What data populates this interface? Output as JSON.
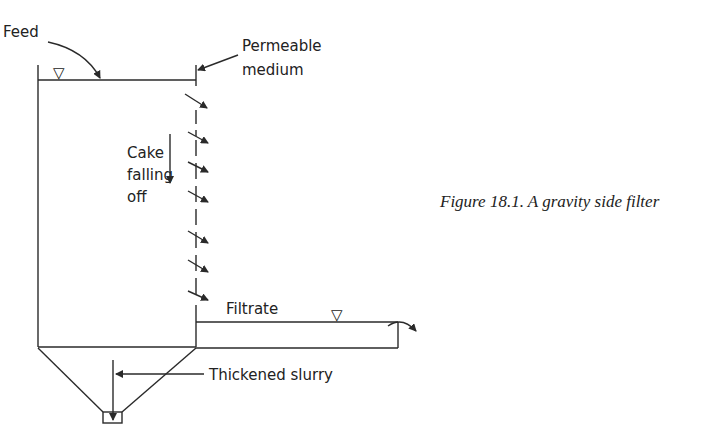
{
  "figure": {
    "caption": "Figure 18.1. A gravity side filter",
    "labels": {
      "feed": "Feed",
      "permeable_line1": "Permeable",
      "permeable_line2": "medium",
      "cake_line1": "Cake",
      "cake_line2": "falling",
      "cake_line3": "off",
      "filtrate": "Filtrate",
      "thickened_slurry": "Thickened slurry"
    },
    "symbols": {
      "liquid_level": "▽"
    },
    "colors": {
      "line": "#2a2a2a",
      "background": "#ffffff"
    }
  }
}
